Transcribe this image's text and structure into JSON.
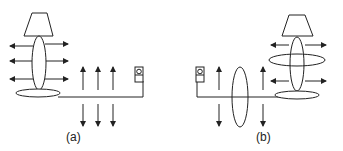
{
  "figure": {
    "colors": {
      "stroke": "#222222",
      "background": "#ffffff"
    },
    "panels": [
      {
        "id": "a",
        "caption": "(a)",
        "description": "Lamp with electric field arrows radiating horizontally from lamp body and vertical field arrows along the cord",
        "elements": {
          "lamp": "left",
          "switch": "right",
          "cord_field_arrows": 3,
          "lamp_field_arrows_per_side": 3,
          "magnetic_loops": 0
        }
      },
      {
        "id": "b",
        "caption": "(b)",
        "description": "Lamp switched on with current: magnetic field loops encircle lamp body and cord in addition to electric field arrows",
        "elements": {
          "lamp": "right",
          "switch": "left",
          "cord_field_arrows": 2,
          "lamp_field_arrows_per_side": 2,
          "magnetic_loops": 2
        }
      }
    ]
  }
}
